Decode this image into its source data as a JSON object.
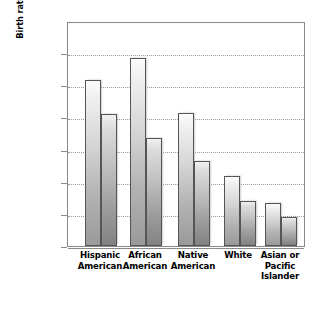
{
  "chart_data": {
    "type": "bar",
    "title": "",
    "xlabel": "",
    "ylabel": "Birth rate per 1,000 women ages 15–19 years",
    "ylabel_lines": [
      "Birth rate per 1,000 women ages",
      "15–19 years"
    ],
    "categories": [
      "Hispanic American",
      "African American",
      "Native American",
      "White",
      "Asian or Pacific Islander"
    ],
    "category_lines": [
      [
        "Hispanic",
        "American"
      ],
      [
        "African",
        "American"
      ],
      [
        "Native",
        "American"
      ],
      [
        "White"
      ],
      [
        "Asian or",
        "Pacific",
        "Islander"
      ]
    ],
    "series": [
      {
        "name": "Series 1",
        "values": [
          103,
          117,
          83,
          43.5,
          27
        ]
      },
      {
        "name": "Series 2",
        "values": [
          82,
          67,
          53,
          28,
          18
        ]
      }
    ],
    "ylim": [
      0,
      140
    ],
    "ytick_values": [
      0,
      20,
      40,
      60,
      80,
      100,
      120,
      140
    ],
    "ytick_labels": [
      "0",
      "20",
      "40",
      "60",
      "80",
      "100",
      "120",
      "140"
    ],
    "grid": true,
    "grid_style": "dotted-horizontal",
    "legend": "none",
    "legend_position": "none",
    "colors": {
      "series_1_top": "#fbfbfb",
      "series_1_bottom": "#9a9a9a",
      "series_2_top": "#f0f0f0",
      "series_2_bottom": "#828282",
      "bar_outline": "#555555",
      "axis": "#8a8a8a",
      "gridline": "#9a9a9a",
      "background": "#ffffff",
      "text": "#000000"
    }
  }
}
